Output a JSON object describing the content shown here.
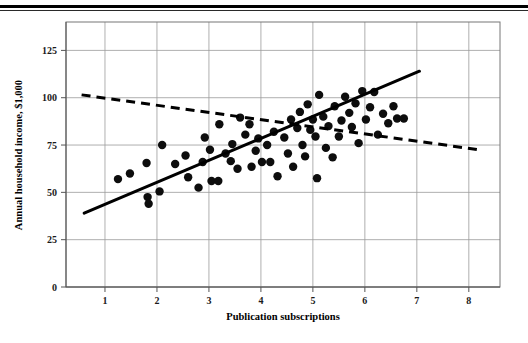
{
  "figure": {
    "background_color": "#ffffff",
    "point_color": "#0d0d0d",
    "line_color": "#000000",
    "grid_color": "#9a9a9a",
    "has_top_rule": true
  },
  "chart_data": {
    "type": "scatter",
    "title": "",
    "xlabel": "Publication subscriptions",
    "ylabel": "Annual household income, $1,000",
    "xlim": [
      0.25,
      8.6
    ],
    "ylim": [
      0,
      140
    ],
    "xticks": [
      1,
      2,
      3,
      4,
      5,
      6,
      7,
      8
    ],
    "xticklabels": [
      "1",
      "2",
      "3",
      "4",
      "5",
      "6",
      "7",
      "8"
    ],
    "yticks": [
      0,
      25,
      50,
      75,
      100,
      125
    ],
    "yticklabels": [
      "0",
      "25",
      "50",
      "75",
      "100",
      "125"
    ],
    "grid": true,
    "legend": null,
    "points": [
      [
        1.25,
        57.0
      ],
      [
        1.48,
        60.0
      ],
      [
        1.8,
        65.5
      ],
      [
        1.82,
        47.5
      ],
      [
        1.84,
        44.0
      ],
      [
        2.05,
        50.5
      ],
      [
        2.1,
        75.0
      ],
      [
        2.35,
        65.0
      ],
      [
        2.55,
        69.5
      ],
      [
        2.6,
        58.0
      ],
      [
        2.8,
        52.5
      ],
      [
        2.88,
        66.0
      ],
      [
        2.92,
        79.0
      ],
      [
        3.02,
        72.5
      ],
      [
        3.05,
        56.0
      ],
      [
        3.18,
        56.0
      ],
      [
        3.2,
        86.0
      ],
      [
        3.32,
        70.5
      ],
      [
        3.42,
        66.5
      ],
      [
        3.45,
        75.5
      ],
      [
        3.55,
        62.5
      ],
      [
        3.6,
        89.5
      ],
      [
        3.7,
        80.5
      ],
      [
        3.78,
        86.0
      ],
      [
        3.82,
        63.5
      ],
      [
        3.9,
        72.0
      ],
      [
        3.95,
        78.5
      ],
      [
        4.02,
        66.0
      ],
      [
        4.12,
        75.0
      ],
      [
        4.18,
        66.0
      ],
      [
        4.25,
        82.0
      ],
      [
        4.32,
        58.5
      ],
      [
        4.45,
        79.0
      ],
      [
        4.52,
        70.5
      ],
      [
        4.58,
        88.5
      ],
      [
        4.62,
        63.5
      ],
      [
        4.7,
        84.0
      ],
      [
        4.75,
        92.5
      ],
      [
        4.8,
        75.0
      ],
      [
        4.85,
        69.0
      ],
      [
        4.9,
        96.5
      ],
      [
        4.95,
        83.0
      ],
      [
        5.0,
        88.5
      ],
      [
        5.05,
        79.5
      ],
      [
        5.08,
        57.5
      ],
      [
        5.12,
        101.5
      ],
      [
        5.2,
        90.0
      ],
      [
        5.25,
        73.5
      ],
      [
        5.3,
        85.0
      ],
      [
        5.38,
        68.5
      ],
      [
        5.42,
        95.5
      ],
      [
        5.5,
        79.5
      ],
      [
        5.55,
        88.0
      ],
      [
        5.62,
        100.5
      ],
      [
        5.7,
        92.0
      ],
      [
        5.75,
        84.5
      ],
      [
        5.82,
        97.0
      ],
      [
        5.88,
        76.0
      ],
      [
        5.95,
        103.5
      ],
      [
        6.02,
        88.5
      ],
      [
        6.1,
        95.0
      ],
      [
        6.18,
        103.0
      ],
      [
        6.25,
        80.5
      ],
      [
        6.35,
        91.5
      ],
      [
        6.45,
        86.5
      ],
      [
        6.55,
        95.5
      ],
      [
        6.62,
        89.0
      ],
      [
        6.75,
        89.0
      ]
    ],
    "trend_lines": [
      {
        "name": "solid-regression-line",
        "style": "solid",
        "x_start": 0.6,
        "y_start": 39.0,
        "x_end": 7.05,
        "y_end": 114.0
      },
      {
        "name": "dashed-regression-line",
        "style": "dashed",
        "x_start": 0.55,
        "y_start": 101.5,
        "x_end": 8.2,
        "y_end": 72.5
      }
    ]
  }
}
